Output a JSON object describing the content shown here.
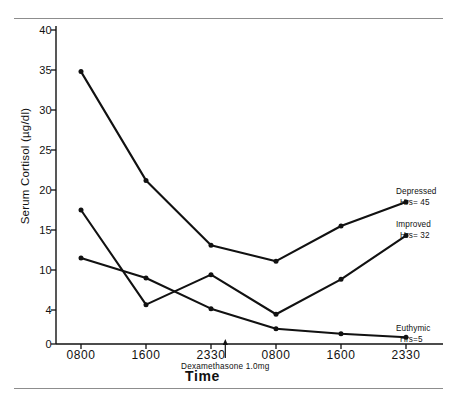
{
  "chart_data": {
    "type": "line",
    "title": "",
    "xlabel": "Time",
    "ylabel": "Serum Cortisol (µg/dl)",
    "x": [
      "0800",
      "1600",
      "2330",
      "0800",
      "1600",
      "2330"
    ],
    "categories": [
      "0800",
      "1600",
      "2330",
      "0800",
      "1600",
      "2330"
    ],
    "ylim": [
      0,
      40
    ],
    "yticks": [
      0,
      4,
      10,
      15,
      20,
      25,
      30,
      35,
      40
    ],
    "ytick_labels": [
      "0",
      "4",
      "10",
      "15",
      "20",
      "25",
      "30",
      "35",
      "40"
    ],
    "grid": false,
    "legend_position": "right-inline",
    "series": [
      {
        "name": "Depressed",
        "label_line1": "Depressed",
        "label_line2": "Hrs= 45",
        "values": [
          34.8,
          21.2,
          13.1,
          11.1,
          15.5,
          18.5
        ]
      },
      {
        "name": "Improved",
        "label_line1": "Improved",
        "label_line2": "Hrs= 32",
        "values": [
          17.5,
          4.8,
          9.3,
          3.5,
          8.6,
          14.3
        ]
      },
      {
        "name": "Euthymic",
        "label_line1": "Euthymic",
        "label_line2": "Hrs=5",
        "values": [
          11.5,
          8.8,
          4.2,
          1.8,
          1.2,
          0.8
        ]
      }
    ],
    "annotations": [
      {
        "text": "Dexamethasone 1.0mg",
        "marker": "arrow-up",
        "x_position": 2.22
      }
    ],
    "line_color": "#111111",
    "marker": "filled-circle"
  }
}
